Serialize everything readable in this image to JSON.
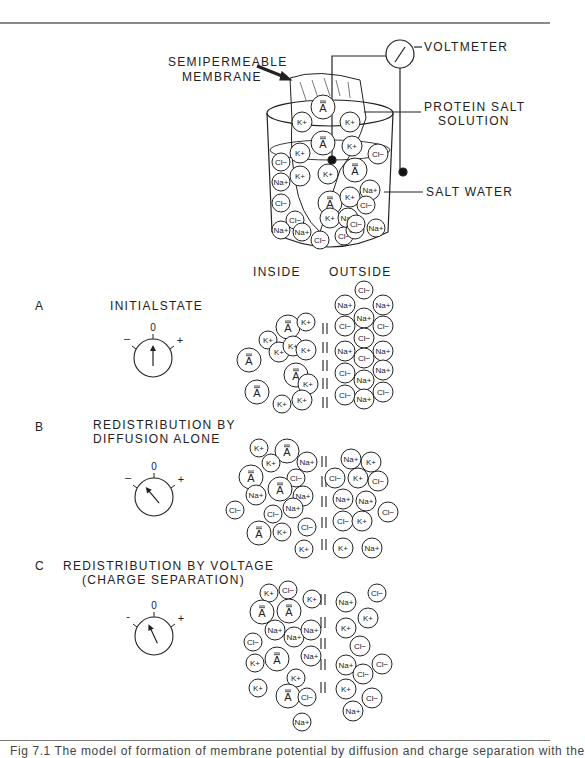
{
  "figure": {
    "apparatus_labels": {
      "membrane_line1": "SEMIPERMEABLE",
      "membrane_line2": "MEMBRANE",
      "voltmeter": "VOLTMETER",
      "protein_line1": "PROTEIN SALT",
      "protein_line2": "SOLUTION",
      "salt_water": "SALT  WATER"
    },
    "column_headers": {
      "inside": "INSIDE",
      "outside": "OUTSIDE"
    },
    "panels": [
      {
        "letter": "A",
        "title_line1": "INITIALSTATE",
        "title_line2": "",
        "meter": {
          "zero": "0",
          "minus": "–",
          "plus": "+",
          "needle_angle_deg": 0
        }
      },
      {
        "letter": "B",
        "title_line1": "REDISTRIBUTION BY",
        "title_line2": "DIFFUSION ALONE",
        "meter": {
          "zero": "0",
          "minus": "–",
          "plus": "+",
          "needle_angle_deg": -40
        }
      },
      {
        "letter": "C",
        "title_line1": "REDISTRIBUTION BY VOLTAGE",
        "title_line2": "(CHARGE SEPARATION)",
        "meter": {
          "zero": "0",
          "minus": "-",
          "plus": "+",
          "needle_angle_deg": -25
        }
      }
    ],
    "ion_labels": {
      "K": "K+",
      "Na": "Na+",
      "Cl": "Cl−",
      "A": "A"
    },
    "ions": {
      "beaker": [
        [
          "A",
          323,
          107,
          12
        ],
        [
          "K",
          302,
          122,
          10
        ],
        [
          "K",
          350,
          122,
          10
        ],
        [
          "A",
          323,
          143,
          12
        ],
        [
          "K",
          300,
          153,
          10
        ],
        [
          "K",
          352,
          146,
          10
        ],
        [
          "Cl",
          378,
          154,
          10
        ],
        [
          "Cl",
          281,
          162,
          9
        ],
        [
          "Na",
          281,
          182,
          9
        ],
        [
          "K",
          300,
          176,
          10
        ],
        [
          "K",
          328,
          174,
          10
        ],
        [
          "A",
          355,
          170,
          12
        ],
        [
          "Na",
          370,
          190,
          10
        ],
        [
          "Cl",
          281,
          203,
          9
        ],
        [
          "A",
          330,
          203,
          12
        ],
        [
          "K",
          350,
          197,
          10
        ],
        [
          "Cl",
          366,
          205,
          9
        ],
        [
          "K",
          330,
          218,
          10
        ],
        [
          "Na",
          348,
          218,
          10
        ],
        [
          "Cl",
          295,
          220,
          9
        ],
        [
          "Na",
          281,
          230,
          9
        ],
        [
          "Na",
          302,
          232,
          9
        ],
        [
          "Cl",
          320,
          240,
          9
        ],
        [
          "Cl",
          344,
          236,
          9
        ],
        [
          "Cl",
          355,
          230,
          9
        ],
        [
          "Na",
          376,
          228,
          9
        ],
        [
          "Cl",
          356,
          224,
          9
        ]
      ],
      "A": [
        [
          "K",
          268,
          340,
          9
        ],
        [
          "A",
          288,
          327,
          12
        ],
        [
          "K",
          306,
          322,
          9
        ],
        [
          "A",
          249,
          360,
          12
        ],
        [
          "K",
          279,
          352,
          10
        ],
        [
          "K",
          293,
          346,
          10
        ],
        [
          "K",
          306,
          350,
          10
        ],
        [
          "A",
          296,
          375,
          12
        ],
        [
          "K",
          308,
          384,
          10
        ],
        [
          "A",
          257,
          392,
          12
        ],
        [
          "K",
          282,
          404,
          9
        ],
        [
          "K",
          302,
          400,
          10
        ],
        [
          "Cl",
          364,
          290,
          9
        ],
        [
          "Na",
          345,
          305,
          10
        ],
        [
          "Na",
          383,
          305,
          10
        ],
        [
          "Na",
          364,
          318,
          10
        ],
        [
          "Cl",
          345,
          326,
          10
        ],
        [
          "Cl",
          383,
          326,
          10
        ],
        [
          "Cl",
          364,
          338,
          10
        ],
        [
          "Na",
          345,
          351,
          10
        ],
        [
          "Cl",
          364,
          358,
          10
        ],
        [
          "Na",
          383,
          351,
          10
        ],
        [
          "Na",
          383,
          370,
          10
        ],
        [
          "Cl",
          345,
          373,
          10
        ],
        [
          "Na",
          364,
          380,
          10
        ],
        [
          "Cl",
          345,
          395,
          10
        ],
        [
          "Na",
          364,
          399,
          10
        ],
        [
          "Cl",
          383,
          392,
          10
        ]
      ],
      "B": [
        [
          "K",
          259,
          448,
          9
        ],
        [
          "A",
          287,
          451,
          12
        ],
        [
          "K",
          271,
          463,
          9
        ],
        [
          "Na",
          307,
          462,
          10
        ],
        [
          "A",
          251,
          477,
          12
        ],
        [
          "Cl",
          296,
          478,
          9
        ],
        [
          "Na",
          256,
          495,
          10
        ],
        [
          "A",
          280,
          489,
          12
        ],
        [
          "Na",
          303,
          496,
          10
        ],
        [
          "Cl",
          235,
          510,
          9
        ],
        [
          "Cl",
          273,
          514,
          9
        ],
        [
          "Na",
          293,
          508,
          10
        ],
        [
          "A",
          259,
          533,
          12
        ],
        [
          "K",
          282,
          532,
          9
        ],
        [
          "Cl",
          307,
          527,
          9
        ],
        [
          "K",
          304,
          549,
          9
        ],
        [
          "Na",
          351,
          459,
          10
        ],
        [
          "K",
          371,
          462,
          10
        ],
        [
          "Cl",
          335,
          478,
          10
        ],
        [
          "K",
          358,
          478,
          10
        ],
        [
          "Cl",
          378,
          481,
          10
        ],
        [
          "Na",
          343,
          499,
          10
        ],
        [
          "Na",
          366,
          501,
          10
        ],
        [
          "Cl",
          388,
          512,
          10
        ],
        [
          "Cl",
          343,
          521,
          10
        ],
        [
          "K",
          362,
          521,
          10
        ],
        [
          "K",
          343,
          548,
          10
        ],
        [
          "Na",
          372,
          548,
          10
        ]
      ],
      "C": [
        [
          "K",
          269,
          593,
          9
        ],
        [
          "Cl",
          288,
          590,
          9
        ],
        [
          "K",
          312,
          599,
          9
        ],
        [
          "A",
          262,
          612,
          12
        ],
        [
          "A",
          289,
          611,
          12
        ],
        [
          "Na",
          275,
          630,
          10
        ],
        [
          "Na",
          294,
          637,
          10
        ],
        [
          "Na",
          311,
          630,
          10
        ],
        [
          "Cl",
          253,
          642,
          9
        ],
        [
          "K",
          255,
          663,
          9
        ],
        [
          "A",
          277,
          659,
          12
        ],
        [
          "Na",
          311,
          656,
          10
        ],
        [
          "K",
          296,
          678,
          9
        ],
        [
          "K",
          258,
          688,
          9
        ],
        [
          "A",
          288,
          696,
          12
        ],
        [
          "Cl",
          307,
          697,
          9
        ],
        [
          "Na",
          302,
          722,
          9
        ],
        [
          "Na",
          346,
          602,
          10
        ],
        [
          "Cl",
          377,
          593,
          9
        ],
        [
          "K",
          368,
          618,
          10
        ],
        [
          "K",
          346,
          628,
          10
        ],
        [
          "Cl",
          360,
          646,
          10
        ],
        [
          "Na",
          346,
          665,
          10
        ],
        [
          "Cl",
          363,
          674,
          10
        ],
        [
          "Cl",
          382,
          664,
          10
        ],
        [
          "K",
          346,
          689,
          10
        ],
        [
          "Cl",
          372,
          698,
          10
        ],
        [
          "Na",
          353,
          711,
          10
        ]
      ]
    },
    "caption": "Fig 7.1  The model of formation of membrane potential by diffusion and charge separation with the"
  }
}
